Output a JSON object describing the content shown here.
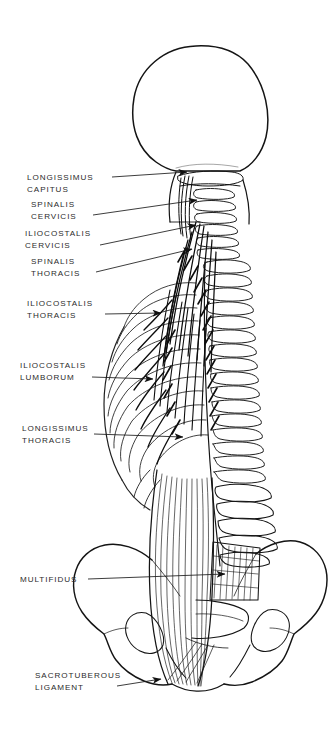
{
  "figure": {
    "background_color": "#ffffff",
    "line_color": "#1a1a1a",
    "text_color": "#2b2b2b",
    "view": "posterior",
    "regions": [
      "skull",
      "cervical-spine",
      "thoracic-spine",
      "rib-cage",
      "lumbar-spine",
      "sacrum",
      "pelvis"
    ]
  },
  "labels": [
    {
      "id": "longissimus-capitus",
      "line1": "LONGISSIMUS",
      "line2": "CAPITUS",
      "x": 27,
      "y": 180,
      "leader": {
        "x1": 112,
        "y1": 177,
        "x2": 187,
        "y2": 172
      }
    },
    {
      "id": "spinalis-cervicis",
      "line1": "SPINALIS",
      "line2": "CERVICIS",
      "x": 31,
      "y": 207,
      "leader": {
        "x1": 93,
        "y1": 215,
        "x2": 197,
        "y2": 200
      }
    },
    {
      "id": "iliocostalis-cervicis",
      "line1": "ILIOCOSTALIS",
      "line2": "CERVICIS",
      "x": 25,
      "y": 236,
      "leader": {
        "x1": 100,
        "y1": 245,
        "x2": 196,
        "y2": 225
      }
    },
    {
      "id": "spinalis-thoracis",
      "line1": "SPINALIS",
      "line2": "THORACIS",
      "x": 31,
      "y": 264,
      "leader": {
        "x1": 96,
        "y1": 272,
        "x2": 192,
        "y2": 249
      }
    },
    {
      "id": "iliocostalis-thoracis",
      "line1": "ILIOCOSTALIS",
      "line2": "THORACIS",
      "x": 27,
      "y": 306,
      "leader": {
        "x1": 105,
        "y1": 314,
        "x2": 161,
        "y2": 313
      }
    },
    {
      "id": "iliocostalis-lumborum",
      "line1": "ILIOCOSTALIS",
      "line2": "LUMBORUM",
      "x": 20,
      "y": 368,
      "leader": {
        "x1": 92,
        "y1": 377,
        "x2": 153,
        "y2": 379
      }
    },
    {
      "id": "longissimus-thoracis",
      "line1": "LONGISSIMUS",
      "line2": "THORACIS",
      "x": 22,
      "y": 431,
      "leader": {
        "x1": 94,
        "y1": 434,
        "x2": 183,
        "y2": 437
      }
    },
    {
      "id": "multifidus",
      "line1": "MULTIFIDUS",
      "line2": "",
      "x": 20,
      "y": 582,
      "leader": {
        "x1": 88,
        "y1": 579,
        "x2": 225,
        "y2": 574
      }
    },
    {
      "id": "sacrotuberous-ligament",
      "line1": "SACROTUBEROUS",
      "line2": "LIGAMENT",
      "x": 35,
      "y": 678,
      "leader": {
        "x1": 117,
        "y1": 686,
        "x2": 161,
        "y2": 679
      }
    }
  ]
}
